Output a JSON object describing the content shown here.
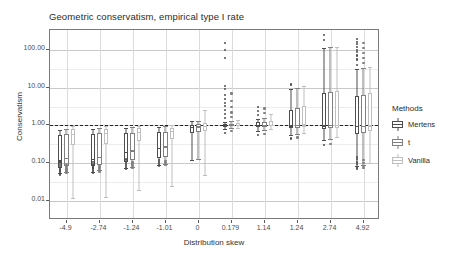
{
  "chart_data": {
    "type": "boxplot",
    "title": "Geometric conservatism, empirical type I rate",
    "xlabel": "Distribution skew",
    "ylabel": "Conservatism",
    "y_scale": "log10",
    "ylim": [
      0.0032,
      330
    ],
    "y_ticks": [
      {
        "value": 100,
        "label": "100.00"
      },
      {
        "value": 10,
        "label": "10.00"
      },
      {
        "value": 1,
        "label": "1.00"
      },
      {
        "value": 0.1,
        "label": "0.10"
      },
      {
        "value": 0.01,
        "label": "0.01"
      }
    ],
    "reference_line": {
      "value": 1.0,
      "style": "dashed",
      "color": "#222222"
    },
    "grid": true,
    "legend": {
      "position": "right",
      "title": "Methods"
    },
    "categories": [
      "-4.9",
      "-2.74",
      "-1.24",
      "-1.01",
      "0",
      "0.179",
      "1.14",
      "1.24",
      "2.74",
      "4.92"
    ],
    "series": [
      {
        "name": "Mertens",
        "color": "#4d4d4d"
      },
      {
        "name": "t",
        "color": "#808080"
      },
      {
        "name": "Vanilla",
        "color": "#bfbfbf"
      }
    ],
    "boxes": [
      {
        "category": "-4.9",
        "series": "Mertens",
        "lower_whisker": 0.055,
        "q1": 0.075,
        "median": 0.12,
        "q3": 0.55,
        "upper_whisker": 0.78,
        "outliers": [
          0.05,
          0.052,
          0.058,
          0.062,
          0.068,
          0.072,
          0.08,
          0.09,
          0.1,
          0.11
        ]
      },
      {
        "category": "-4.9",
        "series": "t",
        "lower_whisker": 0.06,
        "q1": 0.085,
        "median": 0.14,
        "q3": 0.6,
        "upper_whisker": 0.82,
        "outliers": [
          0.055,
          0.06,
          0.065,
          0.07,
          0.075,
          0.085,
          0.095
        ]
      },
      {
        "category": "-4.9",
        "series": "Vanilla",
        "lower_whisker": 0.012,
        "q1": 0.3,
        "median": 0.6,
        "q3": 0.8,
        "upper_whisker": 0.95,
        "outliers": []
      },
      {
        "category": "-2.74",
        "series": "Mertens",
        "lower_whisker": 0.06,
        "q1": 0.085,
        "median": 0.13,
        "q3": 0.58,
        "upper_whisker": 0.8,
        "outliers": [
          0.055,
          0.062,
          0.07,
          0.078,
          0.088,
          0.098,
          0.11
        ]
      },
      {
        "category": "-2.74",
        "series": "t",
        "lower_whisker": 0.065,
        "q1": 0.09,
        "median": 0.15,
        "q3": 0.62,
        "upper_whisker": 0.85,
        "outliers": [
          0.06,
          0.068,
          0.075,
          0.082,
          0.09
        ]
      },
      {
        "category": "-2.74",
        "series": "Vanilla",
        "lower_whisker": 0.013,
        "q1": 0.32,
        "median": 0.62,
        "q3": 0.82,
        "upper_whisker": 0.96,
        "outliers": []
      },
      {
        "category": "-1.24",
        "series": "Mertens",
        "lower_whisker": 0.075,
        "q1": 0.11,
        "median": 0.2,
        "q3": 0.62,
        "upper_whisker": 0.88,
        "outliers": [
          0.07,
          0.08,
          0.09,
          0.1,
          0.12,
          0.13
        ]
      },
      {
        "category": "-1.24",
        "series": "t",
        "lower_whisker": 0.08,
        "q1": 0.12,
        "median": 0.22,
        "q3": 0.65,
        "upper_whisker": 0.9,
        "outliers": [
          0.075,
          0.085,
          0.095,
          0.105
        ]
      },
      {
        "category": "-1.24",
        "series": "Vanilla",
        "lower_whisker": 0.02,
        "q1": 0.4,
        "median": 0.68,
        "q3": 0.86,
        "upper_whisker": 0.98,
        "outliers": []
      },
      {
        "category": "-1.01",
        "series": "Mertens",
        "lower_whisker": 0.09,
        "q1": 0.14,
        "median": 0.26,
        "q3": 0.66,
        "upper_whisker": 0.92,
        "outliers": [
          0.085,
          0.095,
          0.11,
          0.125
        ]
      },
      {
        "category": "-1.01",
        "series": "t",
        "lower_whisker": 0.095,
        "q1": 0.15,
        "median": 0.28,
        "q3": 0.68,
        "upper_whisker": 0.94,
        "outliers": [
          0.09,
          0.1,
          0.115
        ]
      },
      {
        "category": "-1.01",
        "series": "Vanilla",
        "lower_whisker": 0.025,
        "q1": 0.44,
        "median": 0.72,
        "q3": 0.88,
        "upper_whisker": 1.0,
        "outliers": []
      },
      {
        "category": "0",
        "series": "Mertens",
        "lower_whisker": 0.12,
        "q1": 0.62,
        "median": 0.9,
        "q3": 1.05,
        "upper_whisker": 1.3,
        "outliers": []
      },
      {
        "category": "0",
        "series": "t",
        "lower_whisker": 0.13,
        "q1": 0.66,
        "median": 0.94,
        "q3": 1.08,
        "upper_whisker": 1.35,
        "outliers": []
      },
      {
        "category": "0",
        "series": "Vanilla",
        "lower_whisker": 0.05,
        "q1": 0.72,
        "median": 0.98,
        "q3": 1.15,
        "upper_whisker": 2.6,
        "outliers": []
      },
      {
        "category": "0.179",
        "series": "Mertens",
        "lower_whisker": 0.82,
        "q1": 0.92,
        "median": 1.0,
        "q3": 1.1,
        "upper_whisker": 1.25,
        "outliers": [
          0.62,
          1.6,
          2.0,
          2.6,
          3.2,
          4.0,
          5.0,
          6.5,
          9.0,
          11.0,
          60.0,
          100.0,
          150.0
        ]
      },
      {
        "category": "0.179",
        "series": "t",
        "lower_whisker": 0.85,
        "q1": 0.94,
        "median": 1.02,
        "q3": 1.12,
        "upper_whisker": 1.28,
        "outliers": [
          0.7,
          1.7,
          2.2,
          3.0,
          4.5,
          7.0
        ]
      },
      {
        "category": "0.179",
        "series": "Vanilla",
        "lower_whisker": 0.88,
        "q1": 0.96,
        "median": 1.04,
        "q3": 1.16,
        "upper_whisker": 1.4,
        "outliers": []
      },
      {
        "category": "1.14",
        "series": "Mertens",
        "lower_whisker": 0.7,
        "q1": 0.9,
        "median": 1.0,
        "q3": 1.2,
        "upper_whisker": 1.5,
        "outliers": [
          0.55,
          1.9,
          2.4,
          3.0
        ]
      },
      {
        "category": "1.14",
        "series": "t",
        "lower_whisker": 0.74,
        "q1": 0.92,
        "median": 1.02,
        "q3": 1.25,
        "upper_whisker": 1.6,
        "outliers": [
          0.6,
          2.1,
          2.8
        ]
      },
      {
        "category": "1.14",
        "series": "Vanilla",
        "lower_whisker": 0.8,
        "q1": 0.95,
        "median": 1.05,
        "q3": 1.35,
        "upper_whisker": 2.0,
        "outliers": []
      },
      {
        "category": "1.24",
        "series": "Mertens",
        "lower_whisker": 0.55,
        "q1": 0.85,
        "median": 1.0,
        "q3": 2.6,
        "upper_whisker": 9.0,
        "outliers": [
          0.45,
          12.0
        ]
      },
      {
        "category": "1.24",
        "series": "t",
        "lower_whisker": 0.58,
        "q1": 0.88,
        "median": 1.02,
        "q3": 2.8,
        "upper_whisker": 10.0,
        "outliers": [
          0.48
        ]
      },
      {
        "category": "1.24",
        "series": "Vanilla",
        "lower_whisker": 0.62,
        "q1": 0.92,
        "median": 1.06,
        "q3": 3.2,
        "upper_whisker": 11.0,
        "outliers": []
      },
      {
        "category": "2.74",
        "series": "Mertens",
        "lower_whisker": 0.42,
        "q1": 0.8,
        "median": 1.0,
        "q3": 7.0,
        "upper_whisker": 110.0,
        "outliers": [
          0.3,
          180.0,
          240.0
        ]
      },
      {
        "category": "2.74",
        "series": "t",
        "lower_whisker": 0.45,
        "q1": 0.84,
        "median": 1.02,
        "q3": 7.5,
        "upper_whisker": 115.0,
        "outliers": [
          0.33
        ]
      },
      {
        "category": "2.74",
        "series": "Vanilla",
        "lower_whisker": 0.5,
        "q1": 0.88,
        "median": 1.05,
        "q3": 8.0,
        "upper_whisker": 120.0,
        "outliers": []
      },
      {
        "category": "4.92",
        "series": "Mertens",
        "lower_whisker": 0.085,
        "q1": 0.6,
        "median": 0.95,
        "q3": 6.0,
        "upper_whisker": 30.0,
        "outliers": [
          0.07,
          0.075,
          0.08,
          0.095,
          0.11,
          0.13,
          0.15,
          40.0,
          55.0,
          70.0,
          85.0,
          100.0,
          120.0,
          140.0,
          160.0,
          190.0
        ]
      },
      {
        "category": "4.92",
        "series": "t",
        "lower_whisker": 0.09,
        "q1": 0.64,
        "median": 0.97,
        "q3": 6.5,
        "upper_whisker": 32.0,
        "outliers": [
          0.075,
          0.085,
          0.1,
          0.12,
          45.0,
          60.0,
          80.0,
          110.0,
          150.0
        ]
      },
      {
        "category": "4.92",
        "series": "Vanilla",
        "lower_whisker": 0.1,
        "q1": 0.7,
        "median": 1.0,
        "q3": 7.0,
        "upper_whisker": 35.0,
        "outliers": []
      }
    ]
  }
}
